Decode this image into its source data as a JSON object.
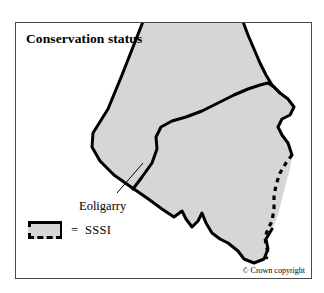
{
  "figure": {
    "title": "Conservation status",
    "copyright": "© Crown copyright"
  },
  "map": {
    "place_labels": [
      {
        "name": "Eoligarry",
        "text": "Eoligarry"
      }
    ],
    "land_fill_color": "#d6d6d6",
    "coastline_color": "#000000",
    "sssi_boundary_color": "#000000",
    "frame_color": "#4a4a4a",
    "background_color": "#ffffff"
  },
  "legend": {
    "equals": "=",
    "label": "SSSI",
    "swatch_fill": "#d6d6d6",
    "swatch_solid_edge_color": "#000000",
    "swatch_dashed_edge_color": "#000000"
  }
}
